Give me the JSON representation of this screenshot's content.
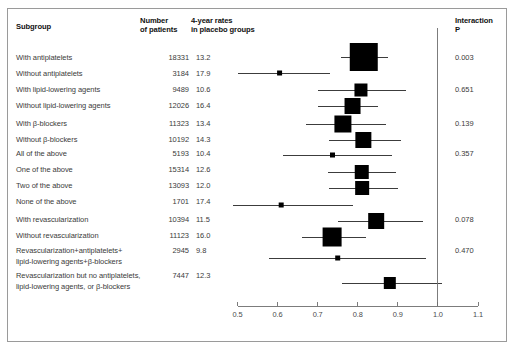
{
  "figure": {
    "title": "",
    "axis_min": 0.5,
    "axis_max": 1.1,
    "reference_value": 1.0,
    "accent_color": "#000000",
    "line_color": "#1a1a1a",
    "axis_color": "#6e6e6e"
  },
  "header": {
    "subgroup": "Subgroup",
    "number_line1": "Number",
    "number_line2": "of patients",
    "rates_line1": "4-year rates",
    "rates_line2": "in placebo groups",
    "interaction_line1": "Interaction",
    "interaction_line2": "P"
  },
  "axis": {
    "ticks": [
      "0.5",
      "0.6",
      "0.7",
      "0.8",
      "0.9",
      "1.0",
      "1.1"
    ],
    "tick_values": [
      0.5,
      0.6,
      0.7,
      0.8,
      0.9,
      1.0,
      1.1
    ]
  },
  "chart_data": {
    "type": "forest",
    "title": "",
    "xlabel": "",
    "ylabel": "",
    "xlim": [
      0.5,
      1.1
    ],
    "reference_line": 1.0,
    "grid": false,
    "columns": [
      "Subgroup",
      "Number of patients",
      "4-year rates in placebo groups",
      "Interaction P"
    ],
    "rows": [
      {
        "label": "With antiplatelets",
        "label2": "",
        "n": "18331",
        "rate": "13.2",
        "p": "0.003",
        "estimate": 0.815,
        "ci_low": 0.757,
        "ci_high": 0.875,
        "box": 28
      },
      {
        "label": "Without antiplatelets",
        "label2": "",
        "n": "3184",
        "rate": "17.9",
        "p": "",
        "estimate": 0.605,
        "ci_low": 0.5,
        "ci_high": 0.732,
        "box": 5
      },
      {
        "label": "With lipid-lowering agents",
        "label2": "",
        "n": "9489",
        "rate": "10.6",
        "p": "0.651",
        "estimate": 0.808,
        "ci_low": 0.702,
        "ci_high": 0.92,
        "box": 13
      },
      {
        "label": "Without lipid-lowering agents",
        "label2": "",
        "n": "12026",
        "rate": "16.4",
        "p": "",
        "estimate": 0.787,
        "ci_low": 0.7,
        "ci_high": 0.85,
        "box": 16
      },
      {
        "label": "With β-blockers",
        "label2": "",
        "n": "11323",
        "rate": "13.4",
        "p": "0.139",
        "estimate": 0.763,
        "ci_low": 0.67,
        "ci_high": 0.87,
        "box": 17
      },
      {
        "label": "Without β-blockers",
        "label2": "",
        "n": "10192",
        "rate": "14.3",
        "p": "",
        "estimate": 0.814,
        "ci_low": 0.728,
        "ci_high": 0.908,
        "box": 16
      },
      {
        "label": "All of the above",
        "label2": "",
        "n": "5193",
        "rate": "10.4",
        "p": "0.357",
        "estimate": 0.737,
        "ci_low": 0.613,
        "ci_high": 0.885,
        "box": 5
      },
      {
        "label": "One of the above",
        "label2": "",
        "n": "15314",
        "rate": "12.6",
        "p": "",
        "estimate": 0.81,
        "ci_low": 0.727,
        "ci_high": 0.895,
        "box": 14
      },
      {
        "label": "Two of the above",
        "label2": "",
        "n": "13093",
        "rate": "12.0",
        "p": "",
        "estimate": 0.811,
        "ci_low": 0.728,
        "ci_high": 0.9,
        "box": 14
      },
      {
        "label": "None of the above",
        "label2": "",
        "n": "1701",
        "rate": "17.4",
        "p": "",
        "estimate": 0.609,
        "ci_low": 0.49,
        "ci_high": 0.787,
        "box": 5
      },
      {
        "label": "With revascularization",
        "label2": "",
        "n": "10394",
        "rate": "11.5",
        "p": "0.078",
        "estimate": 0.846,
        "ci_low": 0.75,
        "ci_high": 0.962,
        "box": 16
      },
      {
        "label": "Without revascularization",
        "label2": "",
        "n": "11123",
        "rate": "16.0",
        "p": "",
        "estimate": 0.736,
        "ci_low": 0.66,
        "ci_high": 0.82,
        "box": 19
      },
      {
        "label": "Revascularization+antiplatelets+",
        "label2": "lipid-lowering agents+β-blockers",
        "n": "2945",
        "rate": "9.8",
        "p": "0.470",
        "estimate": 0.75,
        "ci_low": 0.578,
        "ci_high": 0.97,
        "box": 5
      },
      {
        "label": "Revascularization but no antiplatelets,",
        "label2": "lipid-lowering agents, or β-blockers",
        "n": "7447",
        "rate": "12.3",
        "p": "",
        "estimate": 0.88,
        "ci_low": 0.76,
        "ci_high": 1.01,
        "box": 12
      }
    ]
  }
}
